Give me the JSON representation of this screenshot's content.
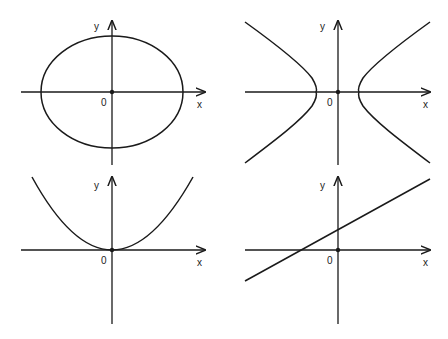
{
  "figure": {
    "colors": {
      "ink": "#1a1a1a",
      "background": "#ffffff"
    },
    "panels": [
      {
        "id": "ellipse",
        "curve": "ellipse",
        "equation_form": "x^2/a^2 + y^2/b^2 = 1",
        "labels": {
          "x": "x",
          "y": "y",
          "origin": "0"
        }
      },
      {
        "id": "hyperbola",
        "curve": "hyperbola",
        "equation_form": "x^2/a^2 - y^2/b^2 = 1",
        "labels": {
          "x": "x",
          "y": "y",
          "origin": "0"
        }
      },
      {
        "id": "parabola",
        "curve": "parabola",
        "equation_form": "y = ax^2",
        "labels": {
          "x": "x",
          "y": "y",
          "origin": "0"
        }
      },
      {
        "id": "line",
        "curve": "straight line",
        "equation_form": "y = mx + c",
        "labels": {
          "x": "x",
          "y": "y",
          "origin": "0"
        }
      }
    ]
  }
}
